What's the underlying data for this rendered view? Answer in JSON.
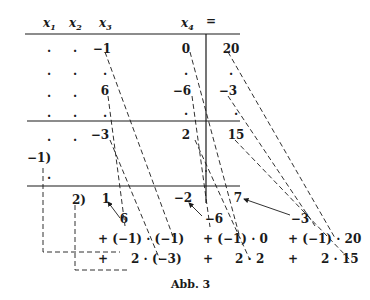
{
  "figure": {
    "caption": "Abb. 3",
    "header": {
      "x1": "x",
      "x2": "x",
      "x3": "x",
      "x4": "x",
      "equals": "=",
      "sub1": "1",
      "sub2": "2",
      "sub3": "3",
      "sub4": "4"
    },
    "rows": [
      {
        "x1": "·",
        "x2": "·",
        "x3": "−1",
        "x4": "0",
        "rhs": "20"
      },
      {
        "x1": "·",
        "x2": "·",
        "x3": "·",
        "x4": "·",
        "rhs": "·"
      },
      {
        "x1": "·",
        "x2": "·",
        "x3": "6",
        "x4": "−6",
        "rhs": "−3"
      },
      {
        "x1": "·",
        "x2": "·",
        "x3": "·",
        "x4": "·",
        "rhs": "·"
      },
      {
        "x1": "·",
        "x2": "·",
        "x3": "−3",
        "x4": "2",
        "rhs": "15"
      }
    ],
    "multipliers": {
      "m1": "−1)",
      "m2": "2)"
    },
    "extra_dot": "·",
    "result_row": {
      "x3": "1",
      "x4": "−2",
      "rhs": "7"
    },
    "pivot_row": {
      "x3": "6",
      "x4": "−6",
      "rhs": "−3"
    },
    "term1": {
      "x3": "+ (−1) · (−1)",
      "x4": "+ (−1) · 0",
      "rhs": "+ (−1) · 20"
    },
    "term2": {
      "x3_plus": "+",
      "x3": "2 · (−3)",
      "x4_plus": "+",
      "x4": "2 · 2",
      "rhs_plus": "+",
      "rhs": "2 · 15"
    }
  }
}
